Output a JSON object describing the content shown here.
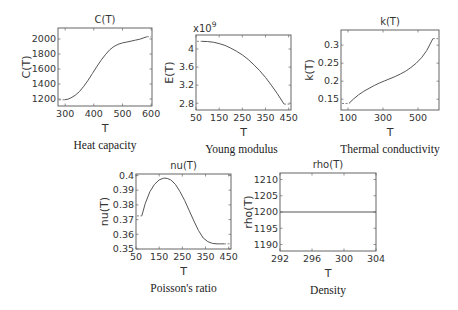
{
  "chart_data": [
    {
      "id": "heat-capacity",
      "type": "line",
      "title": "C(T)",
      "xlabel": "T",
      "ylabel": "C(T)",
      "caption": "Heat capacity",
      "xlim": [
        275,
        603
      ],
      "ylim": [
        1107,
        2147
      ],
      "xticks": [
        300,
        400,
        500,
        600
      ],
      "yticks": [
        1200,
        1400,
        1600,
        1800,
        2000
      ],
      "ytick_labels": [
        "1200",
        "1400",
        "1600",
        "1800",
        "2000"
      ],
      "exponent_label": "",
      "grid": false,
      "frame": {
        "x": 58,
        "y": 28,
        "w": 94,
        "h": 78
      },
      "clamp_left": {
        "x": [
          275,
          298
        ],
        "y": 1190
      },
      "clamp_right": {
        "x": [
          585,
          603
        ],
        "y": 2030
      },
      "x": [
        298,
        310,
        320,
        335,
        350,
        365,
        380,
        395,
        410,
        425,
        440,
        455,
        470,
        485,
        500,
        515,
        530,
        545,
        560,
        575,
        585
      ],
      "y": [
        1190,
        1198,
        1215,
        1250,
        1300,
        1370,
        1450,
        1540,
        1630,
        1715,
        1790,
        1855,
        1900,
        1930,
        1948,
        1960,
        1972,
        1985,
        1997,
        2017,
        2030
      ]
    },
    {
      "id": "young-modulus",
      "type": "line",
      "title": "",
      "xlabel": "T",
      "ylabel": "E(T)",
      "caption": "Young modulus",
      "xlim": [
        50,
        460
      ],
      "ylim": [
        2.65,
        4.31
      ],
      "xticks": [
        50,
        150,
        250,
        350,
        450
      ],
      "yticks": [
        2.8,
        3.2,
        3.6,
        4.0
      ],
      "ytick_labels": [
        "2.8",
        "3.2",
        "3.6",
        "4"
      ],
      "exponent_label": "x10",
      "exponent_power": "9",
      "y_multiplier": 1000000000,
      "grid": false,
      "frame": {
        "x": 196,
        "y": 35,
        "w": 95,
        "h": 75
      },
      "clamp_left": {
        "x": [
          50,
          75
        ],
        "y": 4.17
      },
      "clamp_right": {
        "x": [
          430,
          460
        ],
        "y": 2.78
      },
      "x": [
        75,
        100,
        125,
        150,
        175,
        200,
        225,
        250,
        275,
        300,
        325,
        350,
        375,
        400,
        430
      ],
      "y": [
        4.17,
        4.165,
        4.15,
        4.12,
        4.08,
        4.02,
        3.95,
        3.87,
        3.77,
        3.65,
        3.52,
        3.37,
        3.2,
        3.02,
        2.78
      ]
    },
    {
      "id": "thermal-conductivity",
      "type": "line",
      "title": "k(T)",
      "xlabel": "T",
      "ylabel": "k(T)",
      "caption": "Thermal conductivity",
      "xlim": [
        60,
        620
      ],
      "ylim": [
        0.12,
        0.342
      ],
      "xticks": [
        100,
        300,
        500
      ],
      "yticks": [
        0.15,
        0.2,
        0.25,
        0.3
      ],
      "ytick_labels": [
        "0.15",
        "0.2",
        "0.25",
        "0.3"
      ],
      "exponent_label": "",
      "grid": false,
      "frame": {
        "x": 341,
        "y": 30,
        "w": 98,
        "h": 80
      },
      "clamp_left": {
        "x": [
          60,
          105
        ],
        "y": 0.138
      },
      "clamp_right": {
        "x": [
          585,
          620
        ],
        "y": 0.318
      },
      "x": [
        105,
        130,
        160,
        190,
        220,
        250,
        280,
        310,
        340,
        370,
        400,
        430,
        460,
        490,
        520,
        550,
        585
      ],
      "y": [
        0.138,
        0.15,
        0.162,
        0.172,
        0.18,
        0.188,
        0.195,
        0.201,
        0.207,
        0.213,
        0.22,
        0.228,
        0.238,
        0.25,
        0.265,
        0.285,
        0.318
      ]
    },
    {
      "id": "poisson-ratio",
      "type": "line",
      "title": "nu(T)",
      "xlabel": "T",
      "ylabel": "nu(T)",
      "caption": "Poisson's ratio",
      "xlim": [
        50,
        460
      ],
      "ylim": [
        0.35,
        0.401
      ],
      "xticks": [
        50,
        150,
        250,
        350,
        450
      ],
      "yticks": [
        0.35,
        0.36,
        0.37,
        0.38,
        0.39,
        0.4
      ],
      "ytick_labels": [
        "0.35",
        "0.36",
        "0.37",
        "0.38",
        "0.39",
        "0.4"
      ],
      "exponent_label": "",
      "grid": false,
      "frame": {
        "x": 136,
        "y": 174,
        "w": 95,
        "h": 75
      },
      "clamp_left": {
        "x": [
          50,
          75
        ],
        "y": 0.3725
      },
      "clamp_right": {
        "x": [
          430,
          460
        ],
        "y": 0.3535
      },
      "x": [
        75,
        90,
        110,
        130,
        150,
        170,
        185,
        200,
        220,
        240,
        260,
        280,
        300,
        320,
        340,
        360,
        380,
        400,
        415,
        430
      ],
      "y": [
        0.3725,
        0.381,
        0.389,
        0.394,
        0.397,
        0.3982,
        0.398,
        0.397,
        0.394,
        0.389,
        0.383,
        0.376,
        0.369,
        0.3625,
        0.3575,
        0.355,
        0.3538,
        0.3535,
        0.3535,
        0.3535
      ]
    },
    {
      "id": "density",
      "type": "line",
      "title": "rho(T)",
      "xlabel": "T",
      "ylabel": "rho(T)",
      "caption": "Density",
      "xlim": [
        292,
        304
      ],
      "ylim": [
        1188,
        1212
      ],
      "xticks": [
        292,
        296,
        300,
        304
      ],
      "yticks": [
        1190,
        1195,
        1200,
        1205,
        1210
      ],
      "ytick_labels": [
        "1190",
        "1195",
        "1200",
        "1205",
        "1210"
      ],
      "exponent_label": "",
      "grid": false,
      "frame": {
        "x": 280,
        "y": 173,
        "w": 96,
        "h": 78
      },
      "clamp_left": null,
      "clamp_right": null,
      "x": [
        292,
        304
      ],
      "y": [
        1200,
        1200
      ]
    }
  ]
}
